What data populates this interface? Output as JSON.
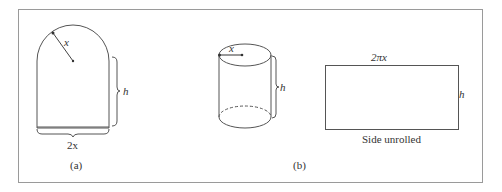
{
  "figure": {
    "panel_a": {
      "caption": "(a)",
      "radius_label": "x",
      "height_label": "h",
      "width_label": "2x"
    },
    "panel_b": {
      "caption": "(b)",
      "radius_label": "x",
      "height_label": "h",
      "unrolled": {
        "width_label": "2πx",
        "height_label": "h",
        "caption": "Side unrolled"
      }
    },
    "colors": {
      "stroke": "#555555",
      "frame": "#9a9a9a",
      "background": "#ffffff"
    }
  }
}
